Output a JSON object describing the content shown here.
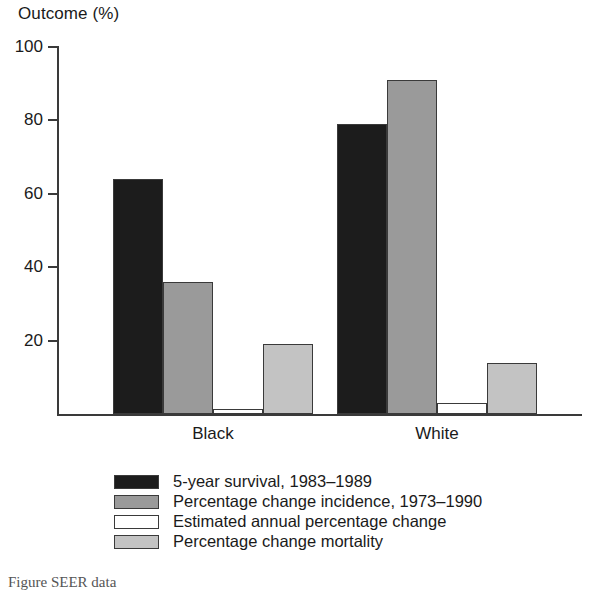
{
  "chart_data": {
    "type": "bar",
    "title": "Outcome (%)",
    "xlabel": "",
    "ylabel": "Outcome (%)",
    "categories": [
      "Black",
      "White"
    ],
    "ylim": [
      0,
      100
    ],
    "yticks": [
      20,
      40,
      60,
      80,
      100
    ],
    "ytick_labels": [
      "20",
      "40",
      "60",
      "80",
      "100"
    ],
    "grid": false,
    "legend_position": "bottom",
    "series": [
      {
        "name": "5-year survival, 1983–1989",
        "color": "#1c1c1c",
        "values": [
          64,
          79
        ]
      },
      {
        "name": "Percentage change incidence, 1973–1990",
        "color": "#9a9a9a",
        "values": [
          36,
          91
        ]
      },
      {
        "name": "Estimated annual percentage change",
        "color": "#ffffff",
        "values": [
          1.5,
          3
        ]
      },
      {
        "name": "Percentage change mortality",
        "color": "#c3c3c3",
        "values": [
          19,
          14
        ]
      }
    ]
  },
  "caption": "Figure                SEER                   data"
}
